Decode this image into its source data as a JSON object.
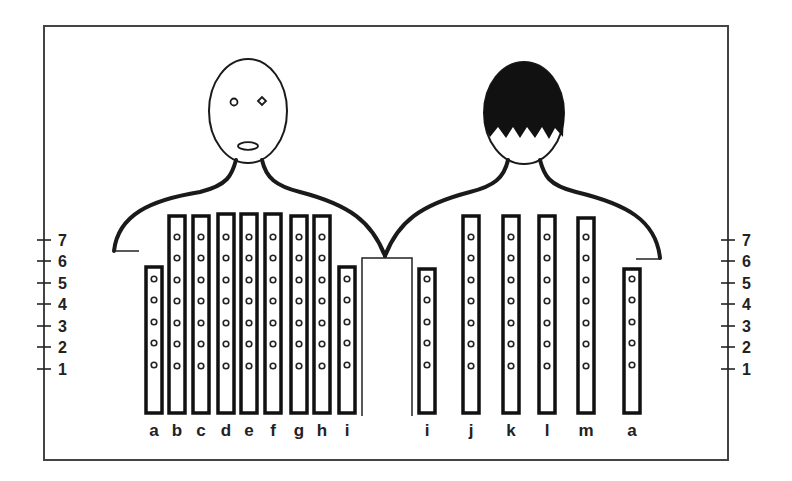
{
  "figure": {
    "frame": {
      "x": 44,
      "y": 26,
      "w": 684,
      "h": 434
    },
    "colors": {
      "line": "#1a1a1a",
      "hair": "#111111",
      "frame": "#444444"
    }
  },
  "left_scale": {
    "labels": [
      "7",
      "6",
      "5",
      "4",
      "3",
      "2",
      "1"
    ],
    "axis_x": 44
  },
  "right_scale": {
    "labels": [
      "7",
      "6",
      "5",
      "4",
      "3",
      "2",
      "1"
    ],
    "axis_x": 728
  },
  "scale_levels_y": [
    240,
    261,
    283,
    304,
    326,
    347,
    369
  ],
  "left_person": {
    "name": "face-front",
    "bars": [
      {
        "label": "a",
        "x": 146,
        "top": 267,
        "dots": 5
      },
      {
        "label": "b",
        "x": 169,
        "top": 216,
        "dots": 7
      },
      {
        "label": "c",
        "x": 193,
        "top": 216,
        "dots": 7
      },
      {
        "label": "d",
        "x": 218,
        "top": 214,
        "dots": 7
      },
      {
        "label": "e",
        "x": 241,
        "top": 214,
        "dots": 7
      },
      {
        "label": "f",
        "x": 265,
        "top": 214,
        "dots": 7
      },
      {
        "label": "g",
        "x": 291,
        "top": 216,
        "dots": 7
      },
      {
        "label": "h",
        "x": 314,
        "top": 216,
        "dots": 7
      },
      {
        "label": "i",
        "x": 339,
        "top": 267,
        "dots": 5
      }
    ]
  },
  "right_person": {
    "name": "back-of-head",
    "bars": [
      {
        "label": "i",
        "x": 419,
        "top": 269,
        "dots": 5
      },
      {
        "label": "j",
        "x": 463,
        "top": 216,
        "dots": 7
      },
      {
        "label": "k",
        "x": 503,
        "top": 216,
        "dots": 7
      },
      {
        "label": "l",
        "x": 539,
        "top": 216,
        "dots": 7
      },
      {
        "label": "m",
        "x": 578,
        "top": 218,
        "dots": 7
      },
      {
        "label": "a",
        "x": 624,
        "top": 269,
        "dots": 5
      }
    ]
  },
  "bar_bottom": 413,
  "bar_width": 16,
  "label_y": 436
}
